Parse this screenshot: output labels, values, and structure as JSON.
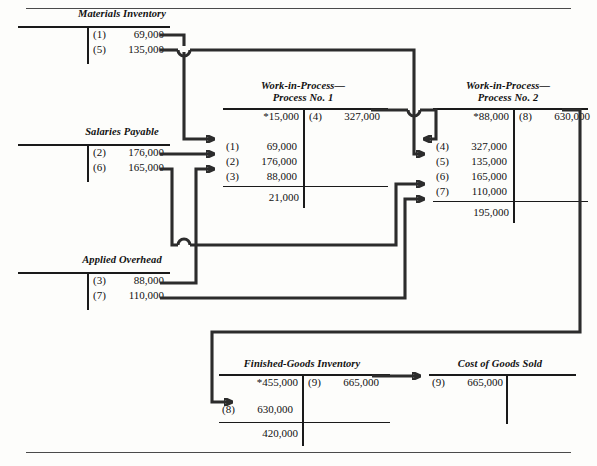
{
  "diagram": {
    "type": "t-account-flow",
    "title_hidden": "Process Costing Cost Flows",
    "rules": {
      "top": "page-rule-top",
      "bottom": "page-rule-bottom"
    }
  },
  "accounts": {
    "materials_inventory": {
      "title": "Materials Inventory",
      "credits": [
        {
          "ref": "(1)",
          "amount": "69,000"
        },
        {
          "ref": "(5)",
          "amount": "135,000"
        }
      ]
    },
    "salaries_payable": {
      "title": "Salaries Payable",
      "credits": [
        {
          "ref": "(2)",
          "amount": "176,000"
        },
        {
          "ref": "(6)",
          "amount": "165,000"
        }
      ]
    },
    "applied_overhead": {
      "title": "Applied Overhead",
      "credits": [
        {
          "ref": "(3)",
          "amount": "88,000"
        },
        {
          "ref": "(7)",
          "amount": "110,000"
        }
      ]
    },
    "wip_process_1": {
      "title": "Work-in-Process—\nProcess No. 1",
      "beginning_balance": "*15,000",
      "debits": [
        {
          "ref": "(1)",
          "amount": "69,000"
        },
        {
          "ref": "(2)",
          "amount": "176,000"
        },
        {
          "ref": "(3)",
          "amount": "88,000"
        }
      ],
      "credits": [
        {
          "ref": "(4)",
          "amount": "327,000"
        }
      ],
      "ending_balance": "21,000"
    },
    "wip_process_2": {
      "title": "Work-in-Process—\nProcess No. 2",
      "beginning_balance": "*88,000",
      "debits": [
        {
          "ref": "(4)",
          "amount": "327,000"
        },
        {
          "ref": "(5)",
          "amount": "135,000"
        },
        {
          "ref": "(6)",
          "amount": "165,000"
        },
        {
          "ref": "(7)",
          "amount": "110,000"
        }
      ],
      "credits": [
        {
          "ref": "(8)",
          "amount": "630,000"
        }
      ],
      "ending_balance": "195,000"
    },
    "finished_goods": {
      "title": "Finished-Goods Inventory",
      "beginning_balance": "*455,000",
      "debits": [
        {
          "ref": "(8)",
          "amount": "630,000"
        }
      ],
      "credits": [
        {
          "ref": "(9)",
          "amount": "665,000"
        }
      ],
      "ending_balance": "420,000"
    },
    "cost_of_goods_sold": {
      "title": "Cost of Goods Sold",
      "debits": [
        {
          "ref": "(9)",
          "amount": "665,000"
        }
      ]
    }
  }
}
